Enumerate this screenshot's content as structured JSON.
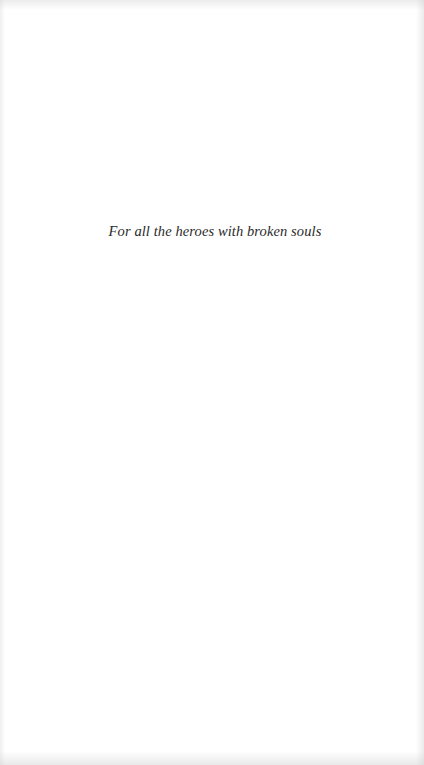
{
  "page": {
    "type": "dedication",
    "dedication_text": "For all the heroes with broken souls"
  }
}
